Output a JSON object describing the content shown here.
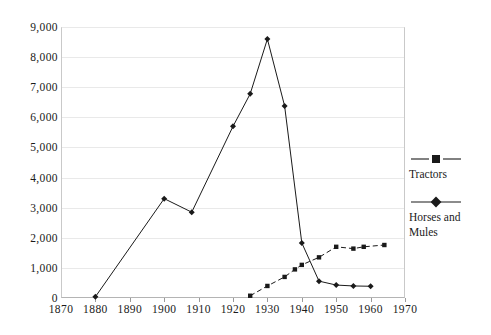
{
  "chart_data": {
    "type": "line",
    "title": "",
    "subtitle": "",
    "xlabel": "",
    "ylabel": "",
    "xlim": [
      1870,
      1970
    ],
    "ylim": [
      0,
      9000
    ],
    "grid": true,
    "legend_position": "right",
    "x_ticks": [
      1870,
      1880,
      1890,
      1900,
      1910,
      1920,
      1930,
      1940,
      1950,
      1960,
      1970
    ],
    "x_tick_labels": [
      "1870",
      "1880",
      "1890",
      "1900",
      "1910",
      "1920",
      "1930",
      "1940",
      "1950",
      "1960",
      "1970"
    ],
    "y_ticks": [
      0,
      1000,
      2000,
      3000,
      4000,
      5000,
      6000,
      7000,
      8000,
      9000
    ],
    "y_tick_labels": [
      "0",
      "1,000",
      "2,000",
      "3,000",
      "4,000",
      "5,000",
      "6,000",
      "7,000",
      "8,000",
      "9,000"
    ],
    "series": [
      {
        "name": "Tractors",
        "marker": "square",
        "linestyle": "dashed",
        "color": "#1a1a1a",
        "points": [
          [
            1925,
            75
          ],
          [
            1930,
            400
          ],
          [
            1935,
            700
          ],
          [
            1938,
            950
          ],
          [
            1940,
            1100
          ],
          [
            1945,
            1350
          ],
          [
            1950,
            1700
          ],
          [
            1955,
            1640
          ],
          [
            1958,
            1700
          ],
          [
            1964,
            1760
          ]
        ]
      },
      {
        "name": "Horses and Mules",
        "marker": "diamond",
        "linestyle": "solid",
        "color": "#1a1a1a",
        "points": [
          [
            1880,
            40
          ],
          [
            1900,
            3300
          ],
          [
            1908,
            2850
          ],
          [
            1920,
            5700
          ],
          [
            1925,
            6780
          ],
          [
            1930,
            8600
          ],
          [
            1935,
            6380
          ],
          [
            1940,
            1830
          ],
          [
            1945,
            560
          ],
          [
            1950,
            430
          ],
          [
            1955,
            400
          ],
          [
            1960,
            390
          ]
        ]
      }
    ]
  },
  "legend": {
    "entries": [
      {
        "label": "Tractors",
        "marker": "square-marker",
        "linestyle": "dashed"
      },
      {
        "label": "Horses and Mules",
        "marker": "diamond-marker",
        "linestyle": "solid"
      }
    ]
  }
}
